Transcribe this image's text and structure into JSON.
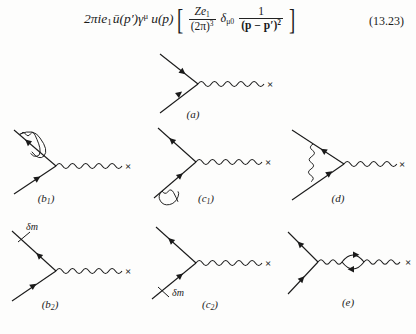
{
  "equation": {
    "prefix": "2πie",
    "prefix_sub": "1",
    "ubar": "ū(p′)γ",
    "gamma_sup": "μ",
    "u_of_p": "u(p)",
    "bracket_open": "[",
    "bracket_close": "]",
    "frac1_num_lead": "Ze",
    "frac1_num_sub": "1",
    "frac1_den": "(2π)",
    "frac1_den_sup": "3",
    "delta_symbol": "δ",
    "delta_sub": "μ0",
    "frac2_num": "1",
    "frac2_den": "(p − p′)",
    "frac2_den_sup": "2",
    "number": "(13.23)"
  },
  "diagrams": [
    {
      "id": "a",
      "label": "(a)",
      "description": "tree-level vertex with external photon ending in cross",
      "x_mark": "×",
      "annotation": null
    },
    {
      "id": "b1",
      "label": "(b₁)",
      "label_main": "(b",
      "label_sub": "1",
      "label_close": ")",
      "description": "self-energy loop on outgoing fermion leg",
      "x_mark": "×",
      "annotation": null
    },
    {
      "id": "c1",
      "label": "(c₁)",
      "label_main": "(c",
      "label_sub": "1",
      "label_close": ")",
      "description": "self-energy loop on incoming fermion leg",
      "x_mark": "×",
      "annotation": null
    },
    {
      "id": "d",
      "label": "(d)",
      "label_main": "(d",
      "label_sub": "",
      "label_close": ")",
      "description": "vertex correction photon bridging both fermion legs",
      "x_mark": "×",
      "annotation": null
    },
    {
      "id": "b2",
      "label": "(b₂)",
      "label_main": "(b",
      "label_sub": "2",
      "label_close": ")",
      "description": "mass counterterm insertion on outgoing fermion leg",
      "x_mark": "×",
      "annotation": "δm"
    },
    {
      "id": "c2",
      "label": "(c₂)",
      "label_main": "(c",
      "label_sub": "2",
      "label_close": ")",
      "description": "mass counterterm insertion on incoming fermion leg",
      "x_mark": "×",
      "annotation": "δm"
    },
    {
      "id": "e",
      "label": "(e)",
      "label_main": "(e",
      "label_sub": "",
      "label_close": ")",
      "description": "vacuum polarization fermion loop on photon line",
      "x_mark": "×",
      "annotation": null
    }
  ],
  "colors": {
    "ink": "#1a1a1a",
    "page": "#fdfdfc"
  }
}
